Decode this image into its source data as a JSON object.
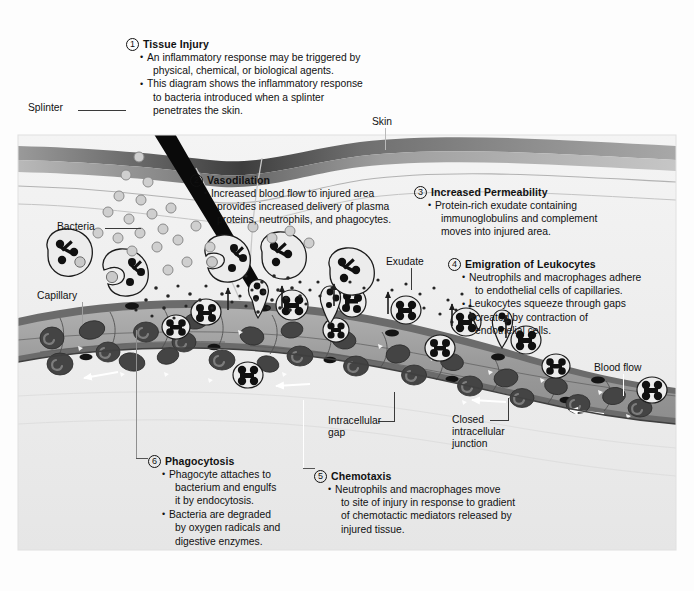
{
  "figure": {
    "background_color": "#fdfdfd",
    "panel_color": "#f1f1f1"
  },
  "steps": [
    {
      "number": "1",
      "title": "Tissue Injury",
      "bullets": [
        "An inflammatory response may be triggered by",
        "physical, chemical, or biological agents.",
        "This diagram shows the inflammatory response",
        "to bacteria introduced when a splinter",
        "penetrates the skin."
      ],
      "bullet_starts": [
        0,
        2
      ]
    },
    {
      "number": "2",
      "title": "Vasodilation",
      "bullets": [
        "Increased blood flow to injured area",
        "provides increased delivery of plasma",
        "proteins, neutrophils, and phagocytes."
      ],
      "bullet_starts": [
        0
      ]
    },
    {
      "number": "3",
      "title": "Increased Permeability",
      "bullets": [
        "Protein-rich exudate containing",
        "immunoglobulins and complement",
        "moves into injured area."
      ],
      "bullet_starts": [
        0
      ]
    },
    {
      "number": "4",
      "title": "Emigration of Leukocytes",
      "bullets": [
        "Neutrophils and macrophages adhere",
        "to endothelial cells of capillaries.",
        "Leukocytes squeeze through gaps",
        "created by contraction of",
        "endothelial cells."
      ],
      "bullet_starts": [
        0,
        2
      ]
    },
    {
      "number": "5",
      "title": "Chemotaxis",
      "bullets": [
        "Neutrophils and macrophages move",
        "to site of injury in response to gradient",
        "of chemotactic mediators released by",
        "injured tissue."
      ],
      "bullet_starts": [
        0
      ]
    },
    {
      "number": "6",
      "title": "Phagocytosis",
      "bullets": [
        "Phagocyte attaches to",
        "bacterium and engulfs",
        "it by endocytosis.",
        "Bacteria are degraded",
        "by oxygen radicals and",
        "digestive enzymes."
      ],
      "bullet_starts": [
        0,
        3
      ]
    }
  ],
  "labels": {
    "splinter": "Splinter",
    "skin": "Skin",
    "bacteria": "Bacteria",
    "capillary": "Capillary",
    "exudate": "Exudate",
    "intracellular_gap_line1": "Intracellular",
    "intracellular_gap_line2": "gap",
    "closed_junction_line1": "Closed",
    "closed_junction_line2": "intracellular",
    "closed_junction_line3": "junction",
    "blood_flow": "Blood flow"
  },
  "credit": "",
  "colors": {
    "splinter": "#0a0a0a",
    "skin_top_band": "#8c8c8c",
    "skin_second_band": "#b3b3b3",
    "dermis": "#f0f0f0",
    "vessel_wall": "#5e5e5e",
    "vessel_lumen": "#a0a0a0",
    "rbc": "#4a4a4a",
    "leukocyte_fill": "#e2e2e2",
    "leukocyte_nucleus": "#111111",
    "bacteria": "#c9c9c9",
    "exudate_dot": "#2a2a2a",
    "text": "#111111"
  }
}
